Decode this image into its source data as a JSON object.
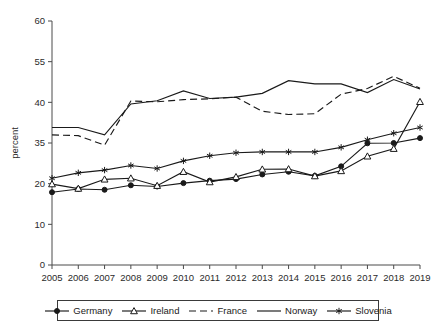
{
  "chart_data": {
    "type": "line",
    "title": "",
    "xlabel": "",
    "ylabel": "percent",
    "categories": [
      "2005",
      "2006",
      "2007",
      "2008",
      "2009",
      "2010",
      "2011",
      "2012",
      "2013",
      "2014",
      "2015",
      "2016",
      "2017",
      "2018",
      "2019"
    ],
    "x": [
      2005,
      2006,
      2007,
      2008,
      2009,
      2010,
      2011,
      2012,
      2013,
      2014,
      2015,
      2016,
      2017,
      2018,
      2019
    ],
    "ytick_labels": [
      "0",
      "10",
      "20",
      "35",
      "40",
      "55",
      "60"
    ],
    "ytick_values": [
      0,
      10,
      20,
      35,
      40,
      55,
      60
    ],
    "ylim": [
      0,
      60
    ],
    "grid": false,
    "legend_position": "bottom",
    "series": [
      {
        "name": "Germany",
        "marker": "filled-circle",
        "line": "solid",
        "values": [
          17.9,
          18.7,
          18.5,
          19.6,
          19.3,
          20.2,
          21.1,
          21.7,
          23.4,
          24.4,
          22.9,
          26.4,
          34.9,
          35.0,
          35.6
        ]
      },
      {
        "name": "Ireland",
        "marker": "hollow-triangle",
        "line": "solid",
        "values": [
          19.9,
          18.8,
          21.6,
          22.0,
          19.5,
          24.4,
          20.6,
          22.5,
          25.3,
          25.4,
          22.8,
          24.7,
          30.1,
          32.9,
          40.2
        ]
      },
      {
        "name": "France",
        "marker": "none",
        "line": "dashed",
        "values": [
          36.0,
          35.9,
          34.2,
          40.5,
          40.2,
          41.0,
          41.3,
          41.9,
          38.9,
          38.5,
          38.6,
          43.0,
          45.1,
          49.6,
          45.2
        ]
      },
      {
        "name": "Norway",
        "marker": "none",
        "line": "solid",
        "values": [
          36.9,
          36.9,
          36.0,
          39.8,
          40.6,
          44.2,
          41.4,
          41.9,
          43.3,
          48.0,
          46.8,
          46.8,
          43.6,
          48.4,
          44.9
        ]
      },
      {
        "name": "Slovenia",
        "marker": "star",
        "line": "solid",
        "values": [
          22.0,
          24.0,
          25.0,
          26.7,
          25.6,
          28.4,
          30.3,
          31.4,
          31.7,
          31.7,
          31.7,
          33.4,
          35.4,
          36.2,
          36.9
        ]
      }
    ]
  },
  "legend": {
    "items": [
      {
        "label": "Germany",
        "marker": "filled-circle",
        "line": "solid"
      },
      {
        "label": "Ireland",
        "marker": "hollow-triangle",
        "line": "solid"
      },
      {
        "label": "France",
        "marker": "none",
        "line": "dashed"
      },
      {
        "label": "Norway",
        "marker": "none",
        "line": "solid"
      },
      {
        "label": "Slovenia",
        "marker": "star",
        "line": "solid"
      }
    ]
  }
}
